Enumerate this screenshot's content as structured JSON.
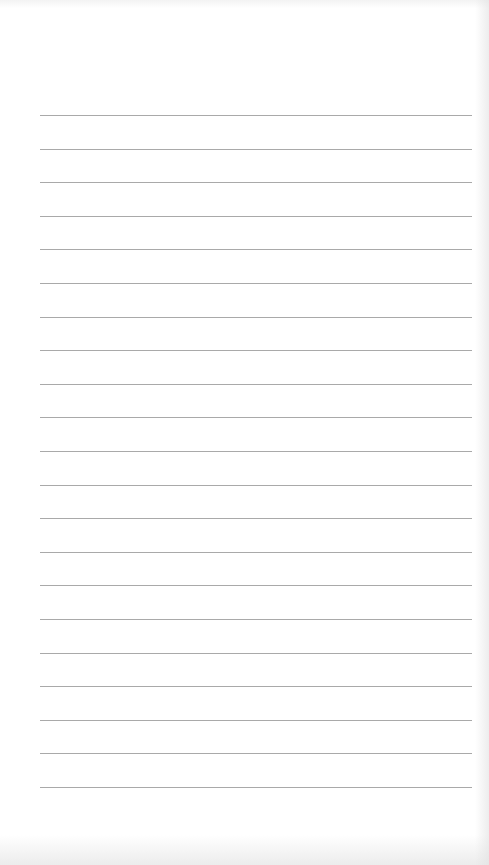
{
  "page": {
    "type": "blank lined paper",
    "line_count": 21,
    "first_line_y": 115,
    "line_spacing": 33.6,
    "line_left": 40,
    "line_right": 472,
    "line_color": "#a9a9a9",
    "paper_color": "#ffffff"
  }
}
